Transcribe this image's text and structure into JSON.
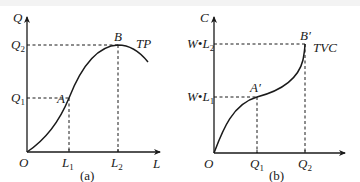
{
  "panel_a": {
    "caption": "(a)",
    "y_axis_label": "Q",
    "x_axis_label": "L",
    "origin_label": "O",
    "y_ticks": [
      {
        "base": "Q",
        "sub": "2"
      },
      {
        "base": "Q",
        "sub": "1"
      }
    ],
    "x_ticks": [
      {
        "base": "L",
        "sub": "1"
      },
      {
        "base": "L",
        "sub": "2"
      }
    ],
    "point_a_label": "A",
    "point_b_label": "B",
    "curve_label": "TP"
  },
  "panel_b": {
    "caption": "(b)",
    "y_axis_label": "C",
    "origin_label": "O",
    "y_ticks": [
      {
        "base": "W•L",
        "sub": "2"
      },
      {
        "base": "W•L",
        "sub": "1"
      }
    ],
    "x_ticks": [
      {
        "base": "Q",
        "sub": "1"
      },
      {
        "base": "Q",
        "sub": "2"
      }
    ],
    "point_a_label": "A′",
    "point_b_label": "B′",
    "curve_label": "TVC"
  },
  "colors": {
    "ink": "#1a1a1a",
    "background": "#ffffff"
  }
}
